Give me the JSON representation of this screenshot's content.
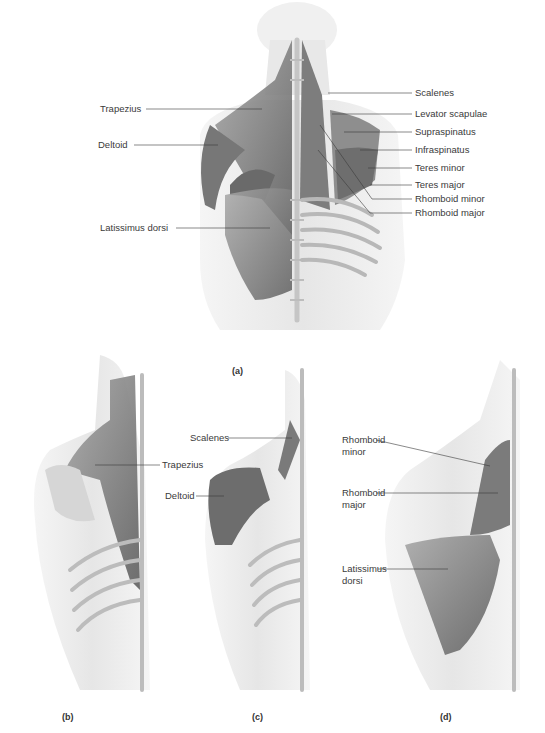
{
  "figure": {
    "panels": {
      "a": {
        "caption": "(a)",
        "labels_left": [
          "Trapezius",
          "Deltoid",
          "Latissimus dorsi"
        ],
        "labels_right": [
          "Scalenes",
          "Levator scapulae",
          "Supraspinatus",
          "Infraspinatus",
          "Teres minor",
          "Teres major",
          "Rhomboid minor",
          "Rhomboid major"
        ]
      },
      "b": {
        "caption": "(b)",
        "labels": [
          "Trapezius"
        ]
      },
      "c": {
        "caption": "(c)",
        "labels": [
          "Scalenes",
          "Deltoid"
        ]
      },
      "d": {
        "caption": "(d)",
        "labels": [
          "Rhomboid minor",
          "Rhomboid major",
          "Latissimus dorsi"
        ]
      }
    },
    "colors": {
      "muscle": "#8a8a8a",
      "muscle_dark": "#5e5e5e",
      "bone": "#d2d2d2",
      "skin": "#ececec",
      "leader_line": "#3a3a3a",
      "text": "#3a3a3a"
    }
  }
}
